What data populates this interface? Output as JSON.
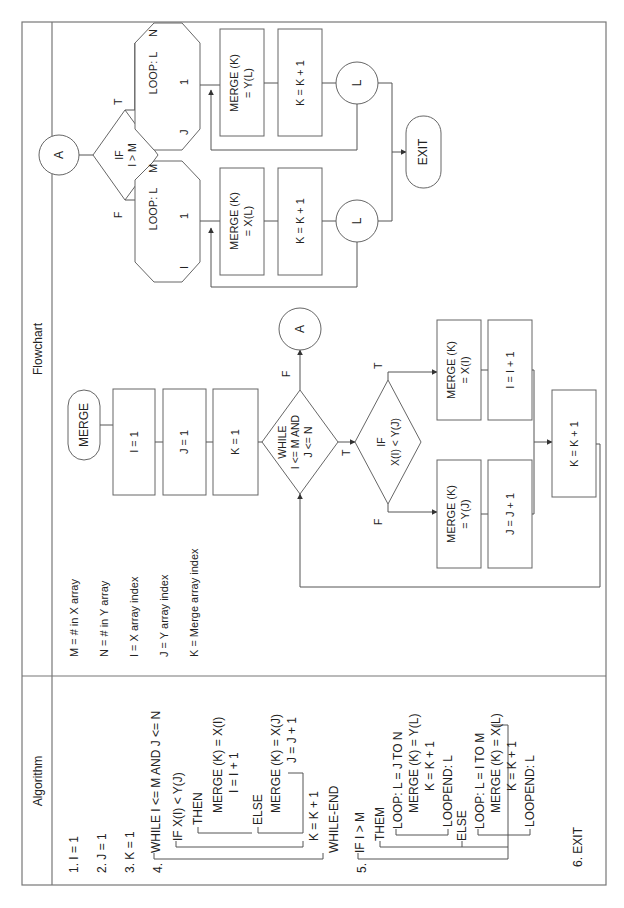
{
  "page": {
    "orientation": "rotated-90-ccw",
    "headers": {
      "algorithm": "Algorithm",
      "flowchart": "Flowchart"
    }
  },
  "legend": [
    "M = # in X array",
    "N = # in Y array",
    "I = X array index",
    "J = Y array index",
    "K = Merge array index"
  ],
  "algorithm": {
    "step1": "1. I = 1",
    "step2": "2. J = 1",
    "step3": "3. K = 1",
    "step4_num": "4.",
    "step4": "WHILE I <= M AND J <= N",
    "if": "IF X(I) < Y(J)",
    "then": "THEN",
    "then_merge": "MERGE (K) = X(I)",
    "then_inc": "I = I + 1",
    "else": "ELSE",
    "else_merge": "MERGE (K) = X(J)",
    "else_inc": "J = J + 1",
    "k_inc": "K = K + 1",
    "while_end": "WHILE-END",
    "step5_num": "5.",
    "step5": "IF I > M",
    "them": "THEM",
    "loop1": "LOOP: L = J TO N",
    "loop1_merge": "MERGE (K) = Y(L)",
    "loop1_inc": "K = K + 1",
    "loop1_end": "LOOPEND: L",
    "else2": "ELSE",
    "loop2": "LOOP: L = I TO M",
    "loop2_merge": "MERGE (K) = X(L)",
    "loop2_inc": "K = K + 1",
    "loop2_end": "LOOPEND: L",
    "step6": "6. EXIT"
  },
  "flowchart": {
    "start": "MERGE",
    "init_i": "I = 1",
    "init_j": "J = 1",
    "init_k": "K = 1",
    "while_l1": "WHILE",
    "while_l2": "I <= M AND",
    "while_l3": "J <= N",
    "if_l1": "IF",
    "if_l2": "X(I) < Y(J)",
    "merge_x_l1": "MERGE (K)",
    "merge_x_l2": "= X(I)",
    "inc_i": "I = I + 1",
    "merge_y_l1": "MERGE (K)",
    "merge_y_l2": "= Y(J)",
    "inc_j": "J = J + 1",
    "inc_k": "K = K + 1",
    "connector_a": "A",
    "label_t": "T",
    "label_f": "F",
    "second": {
      "connector_a": "A",
      "if_l1": "IF",
      "if_l2": "I > M",
      "loop_true": {
        "label": "LOOP: L",
        "start": "J",
        "step": "1",
        "end": "N"
      },
      "loop_false": {
        "label": "LOOP: L",
        "start": "I",
        "step": "1",
        "end": "M"
      },
      "merge_yl_l1": "MERGE (K)",
      "merge_yl_l2": "= Y(L)",
      "merge_xl_l1": "MERGE (K)",
      "merge_xl_l2": "= X(L)",
      "inc_k": "K = K + 1",
      "loop_end": "L",
      "exit": "EXIT"
    }
  }
}
